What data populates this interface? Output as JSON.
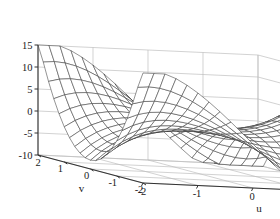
{
  "figure": {
    "kind": "3d-mesh-surface-plot",
    "background_color": "#ffffff",
    "mesh_color": "#3a3a3a",
    "grid_color": "#bfbfbf",
    "axis_color": "#333333"
  },
  "axes": {
    "z": {
      "label": "",
      "ticks": [
        "15",
        "10",
        "5",
        "0",
        "-5",
        "-10"
      ],
      "tick_values": [
        15,
        10,
        5,
        0,
        -5,
        -10
      ],
      "range": [
        -10,
        15
      ]
    },
    "v": {
      "label": "v",
      "ticks": [
        "2",
        "1",
        "0",
        "-1",
        "-2"
      ],
      "tick_values": [
        2,
        1,
        0,
        -1,
        -2
      ],
      "range": [
        -2,
        2
      ]
    },
    "u": {
      "label": "u",
      "ticks": [
        "-2",
        "-1",
        "0",
        "1",
        "2"
      ],
      "tick_values": [
        -2,
        -1,
        0,
        1,
        2
      ],
      "range": [
        -2,
        2
      ]
    }
  },
  "chart_data": {
    "type": "surface",
    "title": "",
    "xlabel": "u",
    "ylabel": "v",
    "zlabel": "",
    "xlim": [
      -2,
      2
    ],
    "ylim": [
      -2,
      2
    ],
    "zlim": [
      -10,
      15
    ],
    "grid": true,
    "legend": null,
    "surface_expression": "z = u^3 - 3*u*v^2",
    "mesh_segments_u": 20,
    "mesh_segments_v": 20,
    "view_azimuth_deg": -37.5,
    "view_elevation_deg": 30,
    "z_tick_values": [
      -10,
      -5,
      0,
      5,
      10,
      15
    ],
    "u_tick_values": [
      -2,
      -1,
      0,
      1,
      2
    ],
    "v_tick_values": [
      -2,
      -1,
      0,
      1,
      2
    ],
    "z_min_observed": -10,
    "z_max_observed": 12
  }
}
